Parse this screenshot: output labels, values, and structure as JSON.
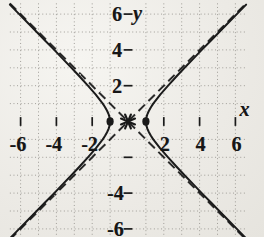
{
  "figure": {
    "kind": "coordinate-plane-graph",
    "background_color": "#efeeea",
    "ink_color": "#1a1a1a",
    "grid_color": "#8e8b85",
    "axis_label_x": "x",
    "axis_label_y": "y"
  },
  "labels": {
    "x_neg_6": "-6",
    "x_neg_4": "-4",
    "x_neg_2": "-2",
    "x_pos_2": "2",
    "x_pos_4": "4",
    "x_pos_6": "6",
    "y_pos_6": "6",
    "y_pos_4": "4",
    "y_pos_2": "2",
    "y_neg_4": "-4",
    "y_neg_6": "-6"
  },
  "chart_data": {
    "type": "line",
    "title": "",
    "subtitle": "",
    "xlabel": "x",
    "ylabel": "y",
    "xlim": [
      -6.6,
      6.6
    ],
    "ylim": [
      -6.6,
      6.6
    ],
    "xticks": [
      -6,
      -4,
      -2,
      2,
      4,
      6
    ],
    "yticks": [
      -6,
      -4,
      -2,
      2,
      4,
      6
    ],
    "xtick_labels": [
      "-6",
      "-4",
      "-2",
      "2",
      "4",
      "6"
    ],
    "ytick_labels": [
      "-6",
      "-4",
      "",
      "2",
      "4",
      "6"
    ],
    "grid": true,
    "grid_style": "dotted",
    "grid_spacing": 1,
    "legend": false,
    "legend_position": "none",
    "annotations": [
      {
        "text": "x",
        "x": 6.2,
        "y": 0.75,
        "role": "axis-name"
      },
      {
        "text": "y",
        "x": 0.55,
        "y": 6.1,
        "role": "axis-name"
      }
    ],
    "series": [
      {
        "name": "hyperbola-right-branch",
        "style": "solid",
        "equation": "x^2 - y^2 = 1, x >= 1",
        "points": [
          [
            1.0,
            0.0
          ],
          [
            1.02,
            0.2
          ],
          [
            1.08,
            0.4
          ],
          [
            1.17,
            0.6
          ],
          [
            1.28,
            0.8
          ],
          [
            1.41,
            1.0
          ],
          [
            1.8,
            1.5
          ],
          [
            2.24,
            2.0
          ],
          [
            2.69,
            2.5
          ],
          [
            3.16,
            3.0
          ],
          [
            3.64,
            3.5
          ],
          [
            4.12,
            4.0
          ],
          [
            4.61,
            4.5
          ],
          [
            5.1,
            5.0
          ],
          [
            5.59,
            5.5
          ],
          [
            6.08,
            6.0
          ],
          [
            6.6,
            6.53
          ]
        ]
      },
      {
        "name": "hyperbola-right-branch-lower",
        "style": "solid",
        "equation": "x^2 - y^2 = 1, x >= 1",
        "points": [
          [
            1.0,
            0.0
          ],
          [
            1.02,
            -0.2
          ],
          [
            1.08,
            -0.4
          ],
          [
            1.17,
            -0.6
          ],
          [
            1.28,
            -0.8
          ],
          [
            1.41,
            -1.0
          ],
          [
            1.8,
            -1.5
          ],
          [
            2.24,
            -2.0
          ],
          [
            2.69,
            -2.5
          ],
          [
            3.16,
            -3.0
          ],
          [
            3.64,
            -3.5
          ],
          [
            4.12,
            -4.0
          ],
          [
            4.61,
            -4.5
          ],
          [
            5.1,
            -5.0
          ],
          [
            5.59,
            -5.5
          ],
          [
            6.08,
            -6.0
          ],
          [
            6.6,
            -6.53
          ]
        ]
      },
      {
        "name": "hyperbola-left-branch",
        "style": "solid",
        "equation": "x^2 - y^2 = 1, x <= -1",
        "points": [
          [
            -1.0,
            0.0
          ],
          [
            -1.02,
            0.2
          ],
          [
            -1.08,
            0.4
          ],
          [
            -1.17,
            0.6
          ],
          [
            -1.28,
            0.8
          ],
          [
            -1.41,
            1.0
          ],
          [
            -1.8,
            1.5
          ],
          [
            -2.24,
            2.0
          ],
          [
            -2.69,
            2.5
          ],
          [
            -3.16,
            3.0
          ],
          [
            -3.64,
            3.5
          ],
          [
            -4.12,
            4.0
          ],
          [
            -4.61,
            4.5
          ],
          [
            -5.1,
            5.0
          ],
          [
            -5.59,
            5.5
          ],
          [
            -6.08,
            6.0
          ],
          [
            -6.6,
            6.53
          ]
        ]
      },
      {
        "name": "hyperbola-left-branch-lower",
        "style": "solid",
        "equation": "x^2 - y^2 = 1, x <= -1",
        "points": [
          [
            -1.0,
            0.0
          ],
          [
            -1.02,
            -0.2
          ],
          [
            -1.08,
            -0.4
          ],
          [
            -1.17,
            -0.6
          ],
          [
            -1.28,
            -0.8
          ],
          [
            -1.41,
            -1.0
          ],
          [
            -1.8,
            -1.5
          ],
          [
            -2.24,
            -2.0
          ],
          [
            -2.69,
            -2.5
          ],
          [
            -3.16,
            -3.0
          ],
          [
            -3.64,
            -3.5
          ],
          [
            -4.12,
            -4.0
          ],
          [
            -4.61,
            -4.5
          ],
          [
            -5.1,
            -5.0
          ],
          [
            -5.59,
            -5.5
          ],
          [
            -6.08,
            -6.0
          ],
          [
            -6.6,
            -6.53
          ]
        ]
      },
      {
        "name": "asymptote-positive-slope",
        "style": "dashed",
        "equation": "y = x",
        "points": [
          [
            -6.6,
            -6.6
          ],
          [
            6.6,
            6.6
          ]
        ]
      },
      {
        "name": "asymptote-negative-slope",
        "style": "dashed",
        "equation": "y = -x",
        "points": [
          [
            -6.6,
            6.6
          ],
          [
            6.6,
            -6.6
          ]
        ]
      }
    ],
    "markers": [
      {
        "name": "vertex-left",
        "x": -1,
        "y": 0,
        "shape": "filled-dot"
      },
      {
        "name": "vertex-right",
        "x": 1,
        "y": 0,
        "shape": "filled-dot"
      },
      {
        "name": "center-origin",
        "x": 0,
        "y": 0,
        "shape": "asterisk"
      }
    ]
  }
}
